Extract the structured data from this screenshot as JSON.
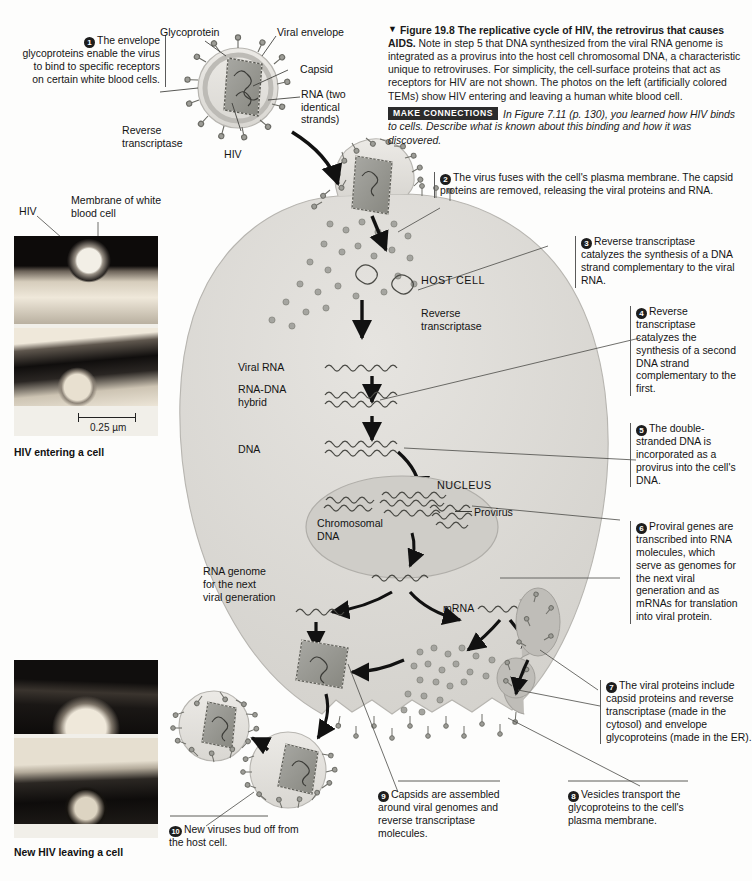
{
  "figure": {
    "marker": "▼",
    "number": "Figure 19.8",
    "title": "The replicative cycle of HIV, the retrovirus that causes AIDS.",
    "body": "Note in step 5 that DNA synthesized from the viral RNA genome is integrated as a provirus into the host cell chromosomal DNA, a characteristic unique to retroviruses. For simplicity, the cell-surface proteins that act as receptors for HIV are not shown. The photos on the left (artificially colored TEMs) show HIV entering and leaving a human white blood cell.",
    "make_connections_badge": "MAKE CONNECTIONS",
    "make_connections_text": "In Figure 7.11 (p. 130), you learned how HIV binds to cells. Describe what is known about this binding and how it was discovered."
  },
  "steps": [
    {
      "num": "1",
      "text": "The envelope glycoproteins enable the virus to bind to specific receptors on certain white blood cells."
    },
    {
      "num": "2",
      "text": "The virus fuses with the cell's plasma membrane. The capsid proteins are removed, releasing the viral proteins and RNA."
    },
    {
      "num": "3",
      "text": "Reverse transcriptase catalyzes the synthesis of a DNA strand complementary to the viral RNA."
    },
    {
      "num": "4",
      "text": "Reverse transcriptase catalyzes the synthesis of a second DNA strand complementary to the first."
    },
    {
      "num": "5",
      "text": "The double-stranded DNA is incorporated as a provirus into the cell's DNA."
    },
    {
      "num": "6",
      "text": "Proviral genes are transcribed into RNA molecules, which serve as genomes for the next viral generation and as mRNAs for translation into viral protein."
    },
    {
      "num": "7",
      "text": "The viral proteins include capsid proteins and reverse transcriptase (made in the cytosol) and envelope glycoproteins (made in the ER)."
    },
    {
      "num": "8",
      "text": "Vesicles transport the glycoproteins to the cell's plasma membrane."
    },
    {
      "num": "9",
      "text": "Capsids are assembled around viral genomes and reverse transcriptase molecules."
    },
    {
      "num": "10",
      "text": "New viruses bud off from the host cell."
    }
  ],
  "virus_labels": {
    "glycoprotein": "Glycoprotein",
    "viral_envelope": "Viral envelope",
    "capsid": "Capsid",
    "rna": "RNA (two identical strands)",
    "reverse_transcriptase": "Reverse transcriptase",
    "name": "HIV"
  },
  "cell_labels": {
    "host_cell": "HOST CELL",
    "reverse_transcriptase": "Reverse transcriptase",
    "viral_rna": "Viral RNA",
    "rna_dna_hybrid": "RNA-DNA hybrid",
    "dna": "DNA",
    "nucleus": "NUCLEUS",
    "chromosomal_dna": "Chromosomal DNA",
    "provirus": "Provirus",
    "rna_genome": "RNA genome for the next viral generation",
    "mrna": "mRNA"
  },
  "micrographs": {
    "top": {
      "label_hiv": "HIV",
      "label_membrane": "Membrane of white blood cell",
      "scale": "0.25 µm",
      "caption": "HIV entering a cell"
    },
    "bottom": {
      "caption": "New HIV leaving a cell"
    }
  },
  "colors": {
    "cytoplasm": "#dcdad6",
    "nucleus": "#cdcbc6",
    "capsid": "#9b9b96",
    "envelope": "#e3e1dc",
    "ink": "#1c1c1c",
    "badge_bg": "#2b2b2b"
  }
}
